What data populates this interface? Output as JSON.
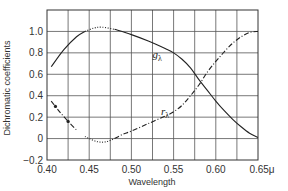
{
  "chart_data": {
    "type": "line",
    "title": "",
    "xlabel": "Wavelength",
    "ylabel": "Dichromatic coefficients",
    "xlim": [
      0.4,
      0.65
    ],
    "ylim": [
      -0.2,
      1.2
    ],
    "grid": true,
    "x_ticks": [
      0.4,
      0.45,
      0.5,
      0.55,
      0.6,
      0.65
    ],
    "x_tick_labels": [
      "0.40",
      "0.45",
      "0.50",
      "0.55",
      "0.60",
      "0.65μ"
    ],
    "x_grid_step": 0.025,
    "y_ticks": [
      -0.2,
      0,
      0.2,
      0.4,
      0.6,
      0.8,
      1.0
    ],
    "y_tick_labels": [
      "−0.2",
      "0",
      "0.2",
      "0.4",
      "0.6",
      "0.8",
      "1.0"
    ],
    "y_grid_step": 0.2,
    "series": [
      {
        "name": "g_λ",
        "label": "g",
        "subscript": "λ",
        "style": "solid",
        "dotted_segment": [
          0.445,
          0.48
        ],
        "x": [
          0.405,
          0.42,
          0.435,
          0.445,
          0.455,
          0.465,
          0.48,
          0.5,
          0.52,
          0.54,
          0.55,
          0.56,
          0.57,
          0.58,
          0.59,
          0.6,
          0.61,
          0.62,
          0.63,
          0.64,
          0.65
        ],
        "y": [
          0.67,
          0.83,
          0.95,
          1.0,
          1.03,
          1.04,
          1.02,
          0.97,
          0.91,
          0.84,
          0.8,
          0.74,
          0.66,
          0.55,
          0.45,
          0.35,
          0.26,
          0.18,
          0.11,
          0.05,
          0.01
        ],
        "label_at": [
          0.525,
          0.75
        ]
      },
      {
        "name": "r_λ",
        "label": "r",
        "subscript": "λ",
        "style": "dash-dot",
        "dotted_segment": [
          0.44,
          0.48
        ],
        "markers_at": [
          0.41,
          0.425
        ],
        "x": [
          0.405,
          0.415,
          0.425,
          0.435,
          0.445,
          0.45,
          0.46,
          0.47,
          0.48,
          0.49,
          0.5,
          0.52,
          0.54,
          0.55,
          0.56,
          0.57,
          0.58,
          0.59,
          0.6,
          0.61,
          0.62,
          0.63,
          0.64,
          0.65
        ],
        "y": [
          0.35,
          0.25,
          0.16,
          0.08,
          0.02,
          0.0,
          -0.03,
          -0.03,
          0.0,
          0.04,
          0.07,
          0.14,
          0.21,
          0.25,
          0.31,
          0.4,
          0.5,
          0.62,
          0.72,
          0.81,
          0.89,
          0.95,
          0.99,
          1.0
        ],
        "label_at": [
          0.535,
          0.22
        ]
      }
    ]
  }
}
